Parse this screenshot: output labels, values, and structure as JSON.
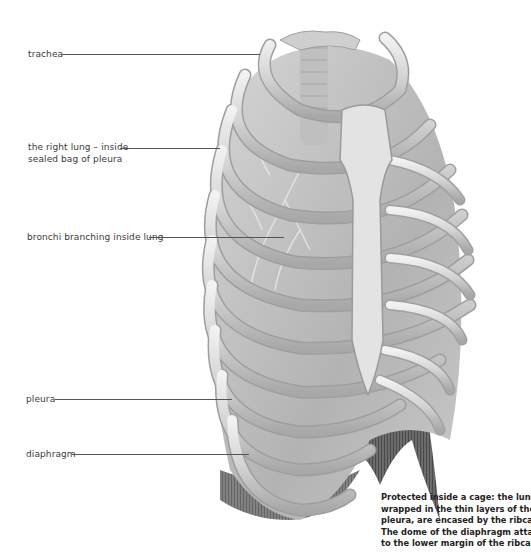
{
  "figure": {
    "labels": [
      {
        "id": "trachea",
        "text_lines": [
          "trachea"
        ]
      },
      {
        "id": "right-lung",
        "text_lines": [
          "the right lung – inside",
          "sealed bag of pleura"
        ]
      },
      {
        "id": "bronchi",
        "text_lines": [
          "bronchi branching inside lung"
        ]
      },
      {
        "id": "pleura",
        "text_lines": [
          "pleura"
        ]
      },
      {
        "id": "diaphragm",
        "text_lines": [
          "diaphragm"
        ]
      }
    ],
    "caption_lines": [
      "Protected inside a cage: the lungs,",
      "wrapped in the thin layers of the",
      "pleura, are encased by the ribcage.",
      "The dome of the diaphragm attaches",
      "to the lower margin of the ribcage."
    ],
    "colors": {
      "background": "#ffffff",
      "bone": "#d9d9d9",
      "bone_shadow": "#9a9a9a",
      "lung": "#bdbdbd",
      "diaphragm": "#5e5e5e",
      "label_text": "#3a3a3a",
      "leader_line": "#555555"
    }
  }
}
